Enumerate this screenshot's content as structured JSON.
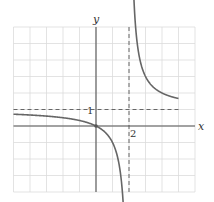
{
  "chart_data": {
    "type": "line",
    "title": "",
    "function": "y = x/(x-2)",
    "xlabel": "x",
    "ylabel": "y",
    "xlim": [
      -5,
      6
    ],
    "ylim": [
      -4,
      6
    ],
    "grid": true,
    "asymptotes": {
      "vertical": 2,
      "horizontal": 1
    },
    "tick_labels": [
      {
        "axis": "y",
        "value": 1,
        "text": "1"
      },
      {
        "axis": "x",
        "value": 2,
        "text": "2"
      }
    ],
    "series": [
      {
        "name": "left-branch",
        "x_range": [
          -5,
          1.85
        ]
      },
      {
        "name": "right-branch",
        "x_range": [
          2.22,
          5
        ]
      }
    ],
    "points": [
      {
        "x": 0,
        "y": 0
      }
    ]
  }
}
